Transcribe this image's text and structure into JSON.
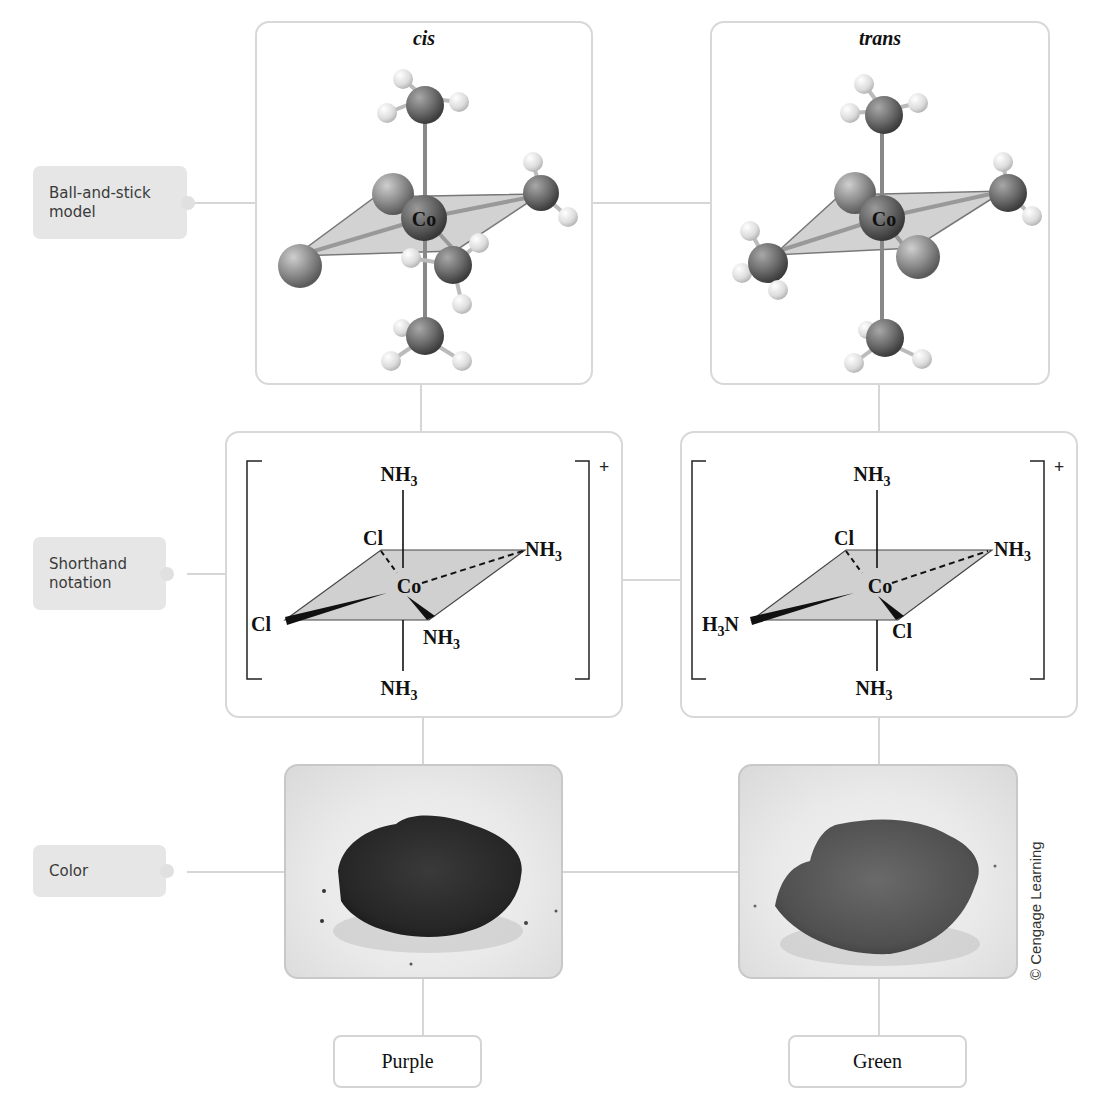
{
  "row_labels": {
    "ball_and_stick": [
      "Ball-and-stick",
      "model"
    ],
    "shorthand": [
      "Shorthand",
      "notation"
    ],
    "color": [
      "Color"
    ]
  },
  "isomers": [
    {
      "name": "cis",
      "center_atom": "Co",
      "charge": "+",
      "ligands": {
        "top": "NH3",
        "bottom": "NH3",
        "back_left": "Cl",
        "back_right": "NH3",
        "front_left": "Cl",
        "front_right": "NH3"
      },
      "color": "Purple",
      "powder_color": "#2b2b2b"
    },
    {
      "name": "trans",
      "center_atom": "Co",
      "charge": "+",
      "ligands": {
        "top": "NH3",
        "bottom": "NH3",
        "back_left": "Cl",
        "back_right": "NH3",
        "front_left": "H3N",
        "front_right": "Cl"
      },
      "color": "Green",
      "powder_color": "#555555"
    }
  ],
  "labels": {
    "cis_title": "cis",
    "trans_title": "trans",
    "co": "Co",
    "cl": "Cl",
    "nh": "NH",
    "hn": "N",
    "h": "H",
    "sub3": "3",
    "plus": "+",
    "purple": "Purple",
    "green": "Green"
  },
  "copyright": "© Cengage Learning",
  "colors": {
    "connector": "#d6d6d6",
    "label_bg": "#e6e6e6",
    "panel_border": "#d8d8d8",
    "plane_fill": "#cfcfcf"
  }
}
